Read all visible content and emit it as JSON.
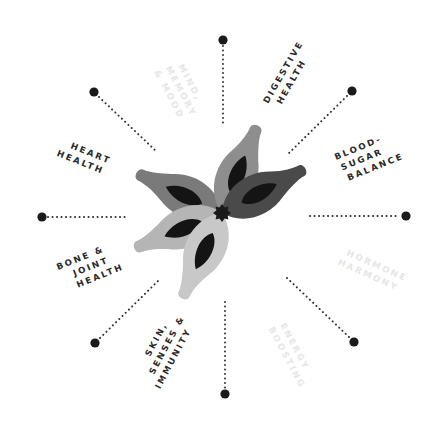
{
  "diagram": {
    "type": "radial-benefit-wheel",
    "center": {
      "x": 222,
      "y": 213,
      "icon": "star-icon",
      "color": "#1a1a1a"
    },
    "colors": {
      "dot": "#1a1a1a",
      "dotted_line": "#333333",
      "label_dark": "#2a2a2a",
      "label_faint": "#e6e6e6",
      "petal_dark": "#4a4a4a",
      "petal_mid": "#7a7a7a",
      "petal_light": "#9d9d9d",
      "petal_lighter": "#b5b5b5",
      "petal_lightest": "#c8c8c8",
      "petal_inner": "#141414"
    },
    "spokes": [
      {
        "id": "mind",
        "lines": [
          "MIND,",
          "MEMORY",
          "& MOOD"
        ],
        "faint": true
      },
      {
        "id": "digestive",
        "lines": [
          "DIGESTIVE",
          "HEALTH"
        ],
        "faint": false
      },
      {
        "id": "blood-sugar",
        "lines": [
          "BLOOD-",
          "SUGAR",
          "BALANCE"
        ],
        "faint": false
      },
      {
        "id": "hormone",
        "lines": [
          "HORMONE",
          "HARMONY"
        ],
        "faint": true
      },
      {
        "id": "energy",
        "lines": [
          "ENERGY",
          "BOOSTING"
        ],
        "faint": true
      },
      {
        "id": "skin",
        "lines": [
          "SKIN,",
          "SENSES &",
          "IMMUNITY"
        ],
        "faint": false
      },
      {
        "id": "bone",
        "lines": [
          "BONE &",
          "JOINT",
          "HEALTH"
        ],
        "faint": false
      },
      {
        "id": "heart",
        "lines": [
          "HEART",
          "HEALTH"
        ],
        "faint": false
      }
    ]
  }
}
